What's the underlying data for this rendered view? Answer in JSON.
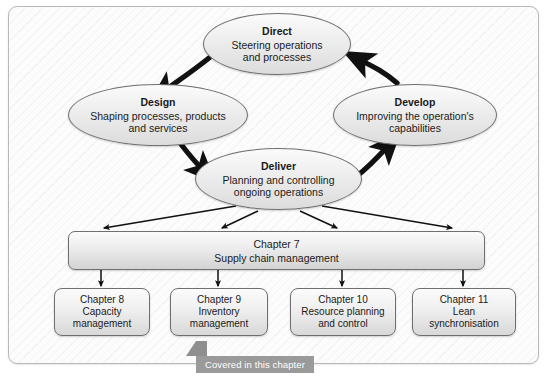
{
  "diagram": {
    "frame_border_color": "#b9b9b9",
    "node_border_color": "#6f6f6f",
    "arrow_color": "#111111",
    "ribbon_color": "#9a9a9a"
  },
  "cycle_nodes": [
    {
      "id": "direct",
      "title": "Direct",
      "description": "Steering operations\nand processes"
    },
    {
      "id": "design",
      "title": "Design",
      "description": "Shaping processes, products\nand services"
    },
    {
      "id": "develop",
      "title": "Develop",
      "description": "Improving the operation's\ncapabilities"
    },
    {
      "id": "deliver",
      "title": "Deliver",
      "description": "Planning and controlling\nongoing operations"
    }
  ],
  "chapter_bar": {
    "chapter": "Chapter 7",
    "topic": "Supply chain management"
  },
  "chapter_boxes": [
    {
      "id": "8",
      "chapter": "Chapter 8",
      "topic": "Capacity\nmanagement"
    },
    {
      "id": "9",
      "chapter": "Chapter 9",
      "topic": "Inventory\nmanagement"
    },
    {
      "id": "10",
      "chapter": "Chapter 10",
      "topic": "Resource planning\nand control"
    },
    {
      "id": "11",
      "chapter": "Chapter 11",
      "topic": "Lean\nsynchronisation"
    }
  ],
  "ribbon": {
    "label": "Covered in this chapter"
  }
}
